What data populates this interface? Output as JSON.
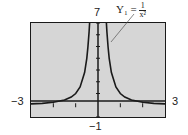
{
  "chart_data": {
    "type": "line",
    "title": "",
    "function": "Y1 = 1/x^2",
    "annotation": {
      "label": "Y₁ =",
      "numerator": "1",
      "denominator": "x²"
    },
    "xlim": [
      -3,
      3
    ],
    "ylim": [
      -1,
      7
    ],
    "x_tick_labels": {
      "min": "−3",
      "max": "3"
    },
    "y_tick_labels": {
      "min": "−1",
      "max": "7"
    },
    "xlabel": "",
    "ylabel": "",
    "grid": false,
    "series": [
      {
        "name": "Y1",
        "x": [
          -3,
          -2.5,
          -2,
          -1.5,
          -1.2,
          -1,
          -0.8,
          -0.6,
          -0.5,
          -0.45,
          -0.4,
          -0.378,
          0.378,
          0.4,
          0.45,
          0.5,
          0.6,
          0.8,
          1,
          1.2,
          1.5,
          2,
          2.5,
          3
        ],
        "values": [
          0.111,
          0.16,
          0.25,
          0.444,
          0.694,
          1,
          1.5625,
          2.778,
          4,
          4.938,
          6.25,
          7,
          7,
          6.25,
          4.938,
          4,
          2.778,
          1.5625,
          1,
          0.694,
          0.444,
          0.25,
          0.16,
          0.111
        ]
      }
    ],
    "colors": {
      "screen": "#d6d6d6",
      "curve": "#1a1a1a",
      "axes": "#1a1a1a"
    }
  }
}
